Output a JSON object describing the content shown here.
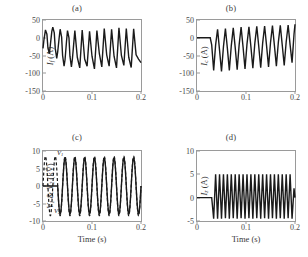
{
  "figure": {
    "background": "#ffffff",
    "line_color": "#1a1a1a",
    "axis_color": "#9a9a9a"
  },
  "panels": [
    {
      "id": "a",
      "title": "(a)",
      "ylabel_main": "I",
      "ylabel_sub": "f",
      "ylabel_unit": " (A)",
      "xlabel": "",
      "yticks": [
        "50",
        "0",
        "-50",
        "-100",
        "-150"
      ],
      "xticks": [
        "0",
        "0.1",
        "0.2"
      ]
    },
    {
      "id": "b",
      "title": "(b)",
      "ylabel_main": "I",
      "ylabel_sub": "c",
      "ylabel_unit": " (A)",
      "xlabel": "",
      "yticks": [
        "50",
        "0",
        "-50",
        "-100",
        "-150"
      ],
      "xticks": [
        "0",
        "0.1",
        "0.2"
      ]
    },
    {
      "id": "c",
      "title": "(c)",
      "ylabel_main": "V",
      "ylabel_sub": "1",
      "ylabel_unit": " (kV)",
      "xlabel": "Time (s)",
      "yticks": [
        "10",
        "5",
        "0",
        "-5",
        "-10"
      ],
      "xticks": [
        "0",
        "0.1",
        "0.2"
      ],
      "annotations": [
        {
          "text": "V1",
          "label_main": "V",
          "label_sub": "1"
        },
        {
          "text": "V2",
          "label_main": "V",
          "label_sub": "2"
        }
      ]
    },
    {
      "id": "d",
      "title": "(d)",
      "ylabel_main": "I",
      "ylabel_sub": "z",
      "ylabel_unit": " (A)",
      "xlabel": "Time (s)",
      "yticks": [
        "10",
        "5",
        "0",
        "-5"
      ],
      "xticks": [
        "0",
        "0.1",
        "0.2"
      ]
    }
  ],
  "chart_data": [
    {
      "type": "line",
      "panel": "a",
      "title": "(a)",
      "xlabel": "Time (s)",
      "ylabel": "I_f (A)",
      "xlim": [
        0,
        0.2
      ],
      "ylim": [
        -150,
        50
      ],
      "xticks": [
        0,
        0.1,
        0.2
      ],
      "yticks": [
        50,
        0,
        -50,
        -100,
        -150
      ],
      "grid": false,
      "legend": "none",
      "series": [
        {
          "name": "I_f",
          "style": "solid",
          "description": "Fault current: damped-offset oscillation at ~50 Hz, peaks near +30 A, initial negative excursions to about -90 A settling toward -70 A",
          "x": [
            0,
            0.002,
            0.005,
            0.008,
            0.01,
            0.013,
            0.015,
            0.018,
            0.02,
            0.023,
            0.025,
            0.028,
            0.03,
            0.033,
            0.035,
            0.038,
            0.04,
            0.043,
            0.045,
            0.048,
            0.05,
            0.053,
            0.055,
            0.058,
            0.06,
            0.065,
            0.07,
            0.075,
            0.08,
            0.085,
            0.09,
            0.095,
            0.1,
            0.105,
            0.11,
            0.115,
            0.12,
            0.125,
            0.13,
            0.135,
            0.14,
            0.145,
            0.15,
            0.155,
            0.16,
            0.165,
            0.17,
            0.175,
            0.18,
            0.185,
            0.19,
            0.195,
            0.2
          ],
          "y": [
            -30,
            -5,
            22,
            10,
            -28,
            -45,
            -20,
            18,
            30,
            14,
            -30,
            -58,
            -40,
            0,
            24,
            2,
            -50,
            -80,
            -62,
            -10,
            20,
            0,
            -52,
            -82,
            -60,
            20,
            -55,
            -85,
            22,
            -60,
            -80,
            18,
            -52,
            -88,
            20,
            -45,
            -82,
            26,
            -48,
            -80,
            24,
            -52,
            -85,
            28,
            -50,
            -78,
            26,
            -55,
            -84,
            25,
            -48,
            -60,
            -70
          ]
        }
      ]
    },
    {
      "type": "line",
      "panel": "b",
      "title": "(b)",
      "xlabel": "Time (s)",
      "ylabel": "I_c (A)",
      "xlim": [
        0,
        0.2
      ],
      "ylim": [
        -150,
        50
      ],
      "xticks": [
        0,
        0.1,
        0.2
      ],
      "yticks": [
        50,
        0,
        -50,
        -100,
        -150
      ],
      "grid": false,
      "legend": "none",
      "series": [
        {
          "name": "I_c",
          "style": "solid",
          "description": "Capacitor current: zero until fault inception at t≈0.027 s, then ~50 Hz oscillation with positive peaks rising from +25 to +38 A and negative peaks near -95 A recovering toward -60 A",
          "x": [
            0,
            0.01,
            0.02,
            0.027,
            0.03,
            0.034,
            0.038,
            0.042,
            0.046,
            0.05,
            0.054,
            0.058,
            0.062,
            0.066,
            0.07,
            0.074,
            0.078,
            0.082,
            0.086,
            0.09,
            0.094,
            0.098,
            0.102,
            0.106,
            0.11,
            0.114,
            0.118,
            0.122,
            0.126,
            0.13,
            0.134,
            0.138,
            0.142,
            0.146,
            0.15,
            0.154,
            0.158,
            0.162,
            0.166,
            0.17,
            0.174,
            0.178,
            0.182,
            0.186,
            0.19,
            0.194,
            0.198,
            0.2
          ],
          "y": [
            0,
            0,
            0,
            0,
            -20,
            -92,
            -20,
            24,
            -35,
            -95,
            -25,
            26,
            -30,
            -92,
            -22,
            28,
            -28,
            -90,
            -20,
            30,
            -26,
            -88,
            -18,
            31,
            -25,
            -86,
            -16,
            32,
            -24,
            -84,
            -15,
            33,
            -23,
            -82,
            -14,
            34,
            -22,
            -80,
            -13,
            35,
            -21,
            -78,
            -12,
            36,
            -20,
            -70,
            10,
            38
          ]
        }
      ]
    },
    {
      "type": "line",
      "panel": "c",
      "title": "(c)",
      "xlabel": "Time (s)",
      "ylabel": "V_1 & V_2 (kV)",
      "xlim": [
        0,
        0.2
      ],
      "ylim": [
        -10,
        10
      ],
      "xticks": [
        0,
        0.1,
        0.2
      ],
      "yticks": [
        10,
        5,
        0,
        -5,
        -10
      ],
      "grid": false,
      "legend": "annotated in-plot",
      "annotations": [
        "V1",
        "V2"
      ],
      "series": [
        {
          "name": "V1",
          "style": "dashed",
          "description": "Source voltage V1: continuous 50 Hz sinusoid amplitude ~8.5 kV present from t=0",
          "amplitude": 8.5,
          "frequency_hz": 50,
          "phase_deg": 0,
          "start_time": 0.0
        },
        {
          "name": "V2",
          "style": "solid",
          "description": "Load-side voltage V2: zero until t≈0.03 s then 50 Hz sinusoid amplitude ~8 kV coincident with V1",
          "amplitude": 8.0,
          "frequency_hz": 50,
          "phase_deg": 0,
          "start_time": 0.03
        }
      ]
    },
    {
      "type": "line",
      "panel": "d",
      "title": "(d)",
      "xlabel": "Time (s)",
      "ylabel": "I_z (A)",
      "xlim": [
        0,
        0.2
      ],
      "ylim": [
        -5,
        10
      ],
      "xticks": [
        0,
        0.1,
        0.2
      ],
      "yticks": [
        10,
        5,
        0,
        -5
      ],
      "grid": false,
      "legend": "none",
      "series": [
        {
          "name": "I_z",
          "style": "solid",
          "description": "Zero-sequence current: flat at 0 A until t≈0.03 s, then sharp-peaked alternating waveform with positive spikes to +5 A and negative spikes to -4.5 A at ~50 Hz",
          "x": [
            0,
            0.01,
            0.02,
            0.03,
            0.034,
            0.038,
            0.042,
            0.046,
            0.05,
            0.054,
            0.058,
            0.062,
            0.066,
            0.07,
            0.074,
            0.078,
            0.082,
            0.086,
            0.09,
            0.094,
            0.098,
            0.102,
            0.106,
            0.11,
            0.114,
            0.118,
            0.122,
            0.126,
            0.13,
            0.134,
            0.138,
            0.142,
            0.146,
            0.15,
            0.154,
            0.158,
            0.162,
            0.166,
            0.17,
            0.174,
            0.178,
            0.182,
            0.186,
            0.19,
            0.194,
            0.198,
            0.2
          ],
          "y": [
            0,
            0,
            0,
            0,
            -4.5,
            5.0,
            -4.5,
            5.0,
            -4.5,
            5.0,
            -4.4,
            5.0,
            -4.5,
            5.0,
            -4.4,
            5.0,
            -4.5,
            5.0,
            -4.4,
            5.0,
            -4.5,
            5.0,
            -4.4,
            5.0,
            -4.5,
            5.0,
            -4.4,
            5.0,
            -4.5,
            5.0,
            -4.4,
            5.0,
            -4.5,
            5.0,
            -4.4,
            5.0,
            -4.5,
            5.0,
            -4.4,
            5.0,
            -4.5,
            5.0,
            -4.4,
            5.0,
            -4.5,
            2.0,
            0
          ]
        }
      ]
    }
  ]
}
